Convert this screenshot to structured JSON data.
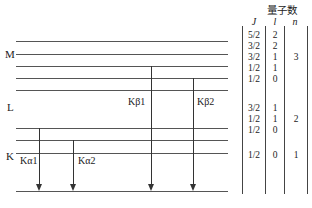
{
  "table": {
    "title": "量子数",
    "headers": {
      "J": "J",
      "l": "l",
      "n": "n"
    },
    "rows": [
      {
        "J": "5/2",
        "l": "2"
      },
      {
        "J": "3/2",
        "l": "2"
      },
      {
        "J": "3/2",
        "l": "1"
      },
      {
        "J": "1/2",
        "l": "1"
      },
      {
        "J": "1/2",
        "l": "0"
      },
      {
        "J": "3/2",
        "l": "1"
      },
      {
        "J": "1/2",
        "l": "1"
      },
      {
        "J": "1/2",
        "l": "0"
      },
      {
        "J": "1/2",
        "l": "0"
      }
    ],
    "n_values": {
      "M": "3",
      "L": "2",
      "K": "1"
    }
  },
  "shells": {
    "M": "M",
    "L": "L",
    "K": "K"
  },
  "transitions": {
    "ka1": "Kα1",
    "ka2": "Kα2",
    "kb1": "Kβ1",
    "kb2": "Kβ2"
  }
}
